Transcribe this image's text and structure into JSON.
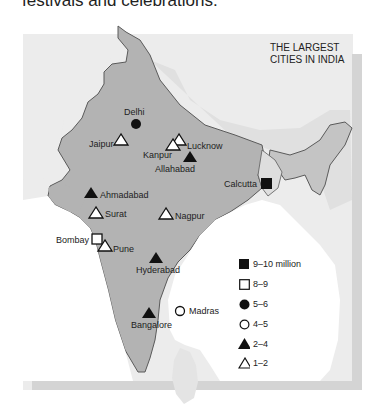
{
  "caption": "festivals and celebrations.",
  "map": {
    "title_line1": "THE LARGEST",
    "title_line2": "CITIES IN INDIA",
    "cities": [
      {
        "name": "Delhi",
        "category": "5-6"
      },
      {
        "name": "Jaipur",
        "category": "1-2"
      },
      {
        "name": "Kanpur",
        "category": "1-2"
      },
      {
        "name": "Lucknow",
        "category": "1-2"
      },
      {
        "name": "Allahabad",
        "category": "2-4"
      },
      {
        "name": "Calcutta",
        "category": "9-10 million"
      },
      {
        "name": "Ahmadabad",
        "category": "2-4"
      },
      {
        "name": "Surat",
        "category": "1-2"
      },
      {
        "name": "Nagpur",
        "category": "1-2"
      },
      {
        "name": "Bombay",
        "category": "8-9"
      },
      {
        "name": "Pune",
        "category": "1-2"
      },
      {
        "name": "Hyderabad",
        "category": "2-4"
      },
      {
        "name": "Bangalore",
        "category": "2-4"
      },
      {
        "name": "Madras",
        "category": "4-5"
      }
    ]
  },
  "legend": {
    "items": [
      {
        "symbol": "filled-square",
        "label": "9–10 million"
      },
      {
        "symbol": "open-square",
        "label": "8–9"
      },
      {
        "symbol": "filled-circle",
        "label": "5–6"
      },
      {
        "symbol": "open-circle",
        "label": "4–5"
      },
      {
        "symbol": "filled-triangle",
        "label": "2–4"
      },
      {
        "symbol": "open-triangle",
        "label": "1–2"
      }
    ]
  },
  "colors": {
    "india_fill": "#b3b3b3",
    "neighbor_fill": "#cfcfcf",
    "background": "#ececec",
    "border": "#5a5a5a"
  }
}
